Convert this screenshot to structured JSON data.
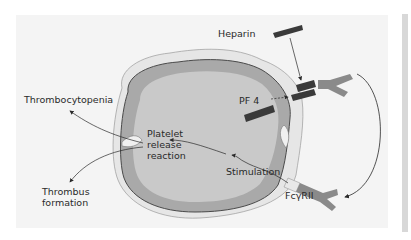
{
  "diagram": {
    "type": "heparin-induced thrombocytopenia mechanism",
    "labels": {
      "heparin": "Heparin",
      "pf4": "PF 4",
      "thrombocytopenia": "Thrombocytopenia",
      "platelet_line1": "Platelet",
      "platelet_line2": "release",
      "platelet_line3": "reaction",
      "stimulation": "Stimulation",
      "thrombus_line1": "Thrombus",
      "thrombus_line2": "formation",
      "fc_receptor": "FcγRII"
    },
    "colors": {
      "panel_bg": "#f4f4f4",
      "cell_inner": "#c9c9c9",
      "cell_band": "#a9a9a9",
      "cell_outline": "#4a4a4a",
      "halo": "#e6e6e6",
      "heparin_bar": "#3a3a3a",
      "antibody": "#8a8a8a",
      "text": "#2a2a2a"
    }
  }
}
